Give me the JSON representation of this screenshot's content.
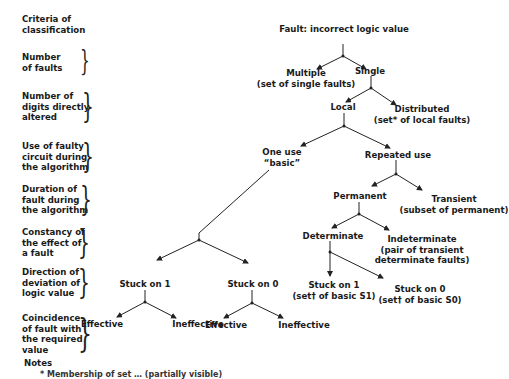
{
  "criteria": {
    "heading": "Criteria of\nclassification",
    "rows": [
      {
        "label": "Number\nof faults"
      },
      {
        "label": "Number of\ndigits directly\naltered"
      },
      {
        "label": "Use of faulty\ncircuit during\nthe algorithm"
      },
      {
        "label": "Duration of\nfault during\nthe algorithm"
      },
      {
        "label": "Constancy of\nthe effect of\na fault"
      },
      {
        "label": "Direction of\ndeviation of\nlogic value"
      },
      {
        "label": "Coincidence\nof fault with\nthe required\nvalue"
      }
    ],
    "notes_label": "Notes"
  },
  "tree": {
    "root": "Fault: incorrect logic value",
    "multiple": "Multiple\n(set of single faults)",
    "single": "Single",
    "local": "Local",
    "distributed": "Distributed\n(set* of local faults)",
    "one_use": "One use\n“basic”",
    "repeated_use": "Repeated use",
    "permanent": "Permanent",
    "transient": "Transient\n(subset of permanent)",
    "determinate": "Determinate",
    "indeterminate": "Indeterminate\n(pair of transient\ndeterminate faults)",
    "det_stuck1": "Stuck on 1\n(set† of basic S1)",
    "det_stuck0": "Stuck on 0\n(set† of basic S0)",
    "basic_stuck1": "Stuck on 1",
    "basic_stuck0": "Stuck on 0",
    "s1_effective": "Effective",
    "s1_ineffective": "Ineffective",
    "s0_effective": "Effective",
    "s0_ineffective": "Ineffective"
  },
  "footnote": "* Membership of set … (partially visible)"
}
